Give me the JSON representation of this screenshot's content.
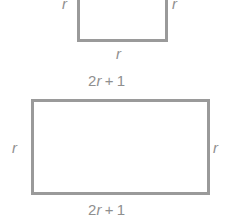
{
  "figure": {
    "stroke_color": "#9a9a9a",
    "text_color": "#8f8f8f",
    "background_color": "#ffffff"
  },
  "square": {
    "name": "square-figure",
    "label_left": "r",
    "label_right": "r",
    "label_bottom": "r"
  },
  "rectangle": {
    "name": "rectangle-figure",
    "label_top_coef": "2",
    "label_top_var": "r",
    "label_top_op": "+",
    "label_top_const": "1",
    "label_bottom_coef": "2",
    "label_bottom_var": "r",
    "label_bottom_op": "+",
    "label_bottom_const": "1",
    "label_left": "r",
    "label_right": "r"
  }
}
